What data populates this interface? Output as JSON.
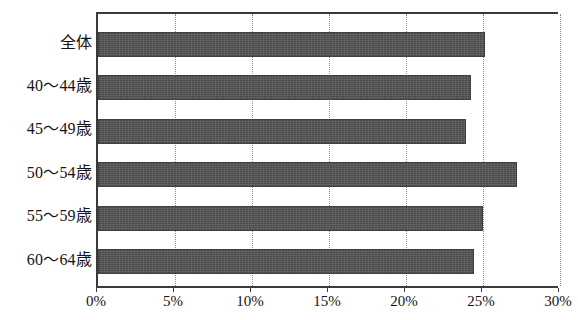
{
  "chart_data": {
    "type": "bar",
    "orientation": "horizontal",
    "title": "",
    "subtitle": "",
    "xlabel": "",
    "ylabel": "",
    "categories": [
      "全体",
      "40～44歳",
      "45～49歳",
      "50～54歳",
      "55～59歳",
      "60～64歳"
    ],
    "values": [
      25.1,
      24.2,
      23.9,
      27.2,
      25.0,
      24.4
    ],
    "value_unit": "%",
    "xlim": [
      0,
      30
    ],
    "xticks": [
      0,
      5,
      10,
      15,
      20,
      25,
      30
    ],
    "xtick_labels": [
      "0%",
      "5%",
      "10%",
      "15%",
      "20%",
      "25%",
      "30%"
    ],
    "grid": "vertical-dotted",
    "legend": "none",
    "series": [
      {
        "name": "",
        "color": "#4b4b4b",
        "values": [
          25.1,
          24.2,
          23.9,
          27.2,
          25.0,
          24.4
        ]
      }
    ],
    "annotations": []
  },
  "style": {
    "bar_color": "#4b4b4b",
    "axis_color": "#3a3a3a",
    "grid_color": "#8a8a8a",
    "text_color": "#141414",
    "background": "#ffffff"
  }
}
